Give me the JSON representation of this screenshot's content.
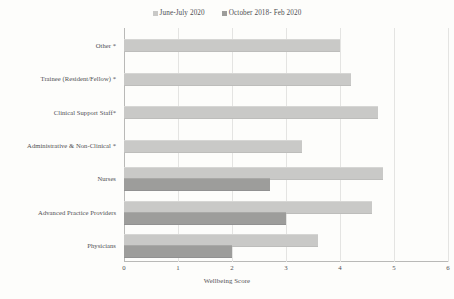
{
  "chart_data": {
    "type": "bar",
    "orientation": "horizontal",
    "title": "",
    "xlabel": "Wellbeing Score",
    "ylabel": "",
    "xlim": [
      0,
      6
    ],
    "xticks": [
      "0",
      "1",
      "2",
      "3",
      "4",
      "5",
      "6"
    ],
    "grid": true,
    "legend_position": "top-center",
    "categories": [
      "Other *",
      "Trainee (Resident/Fellow) *",
      "Clinical Support Staff*",
      "Administrative & Non-Clinical *",
      "Nurses",
      "Advanced Practice Providers",
      "Physicians"
    ],
    "series": [
      {
        "name": "June-July 2020",
        "color": "#c9c9c7",
        "values": [
          4.0,
          4.2,
          4.7,
          3.3,
          4.8,
          4.6,
          3.6
        ]
      },
      {
        "name": "October 2018- Feb 2020",
        "color": "#9d9d9b",
        "values": [
          null,
          null,
          null,
          null,
          2.7,
          3.0,
          2.0
        ]
      }
    ]
  },
  "legend": {
    "items": [
      {
        "label": "June-July 2020",
        "color": "#c9c9c7"
      },
      {
        "label": "October 2018- Feb 2020",
        "color": "#9d9d9b"
      }
    ]
  },
  "axis": {
    "x_title": "Wellbeing Score"
  }
}
